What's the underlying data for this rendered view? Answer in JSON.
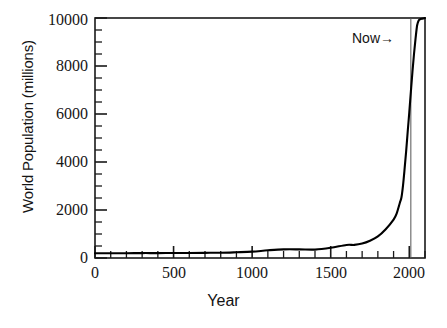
{
  "figure": {
    "name": "world-population-vs-year-plot",
    "background_color": "#ffffff",
    "axis_color": "#1a1a1a",
    "curve_color": "#000000",
    "now_line_color": "#555555"
  },
  "chart_data": {
    "type": "line",
    "title": "",
    "xlabel": "Year",
    "ylabel": "World Population (millions)",
    "xlim": [
      0,
      2100
    ],
    "ylim": [
      0,
      10000
    ],
    "grid": false,
    "legend": null,
    "x_major_ticks": [
      0,
      500,
      1000,
      1500,
      2000
    ],
    "x_major_tick_labels": [
      "0",
      "500",
      "1000",
      "1500",
      "2000"
    ],
    "x_minor_tick_interval": 100,
    "y_major_ticks": [
      0,
      2000,
      4000,
      6000,
      8000,
      10000
    ],
    "y_major_tick_labels": [
      "0",
      "2000",
      "4000",
      "6000",
      "8000",
      "10000"
    ],
    "y_minor_tick_interval": 500,
    "annotations": [
      {
        "name": "now-marker",
        "text": "Now→",
        "x": 2010,
        "y": 9200,
        "type": "vertical-line-with-label"
      }
    ],
    "series": [
      {
        "name": "World Population",
        "x": [
          0,
          100,
          200,
          300,
          400,
          500,
          600,
          700,
          800,
          900,
          1000,
          1100,
          1200,
          1300,
          1400,
          1500,
          1600,
          1650,
          1700,
          1750,
          1800,
          1850,
          1900,
          1920,
          1940,
          1950,
          1960,
          1970,
          1980,
          1990,
          2000,
          2010,
          2020,
          2030,
          2040,
          2050,
          2060,
          2070,
          2080,
          2090,
          2100
        ],
        "y": [
          200,
          195,
          200,
          205,
          205,
          210,
          210,
          215,
          220,
          240,
          265,
          320,
          360,
          360,
          350,
          425,
          545,
          545,
          600,
          720,
          900,
          1200,
          1600,
          1860,
          2300,
          2520,
          3020,
          3700,
          4440,
          5270,
          6070,
          6920,
          7750,
          8500,
          9150,
          9700,
          9900,
          9950,
          9970,
          9980,
          10000
        ]
      }
    ]
  }
}
